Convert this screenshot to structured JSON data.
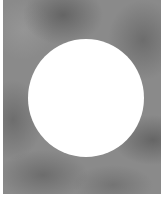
{
  "image": {
    "description": "Grayscale cloudy texture with white circular cutout",
    "colors": {
      "texture_base": "#8a8a8a",
      "circle": "#ffffff",
      "background": "#ffffff"
    }
  }
}
